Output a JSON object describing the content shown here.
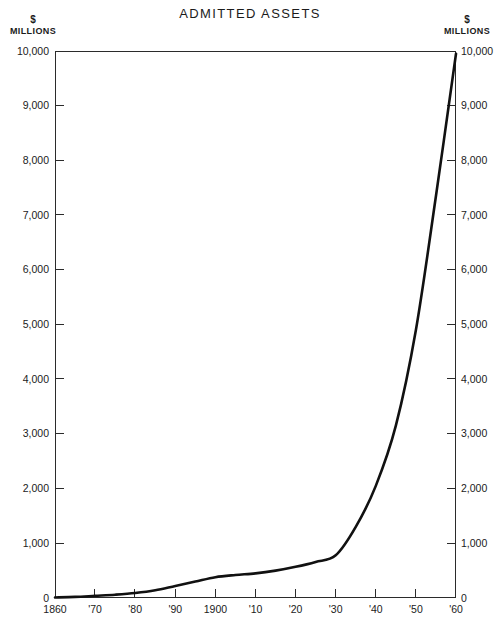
{
  "chart_data": {
    "type": "line",
    "title": "ADMITTED ASSETS",
    "xlabel": "",
    "ylabel": "$ MILLIONS",
    "unit_caption_dollar": "$",
    "unit_caption_millions": "MILLIONS",
    "grid": false,
    "legend": "none",
    "xlim": [
      1860,
      1960
    ],
    "ylim": [
      0,
      10000
    ],
    "y_ticks": [
      0,
      1000,
      2000,
      3000,
      4000,
      5000,
      6000,
      7000,
      8000,
      9000,
      10000
    ],
    "y_tick_labels": [
      "0",
      "1,000",
      "2,000",
      "3,000",
      "4,000",
      "5,000",
      "6,000",
      "7,000",
      "8,000",
      "9,000",
      "10,000"
    ],
    "y_axis_left_labels": [
      "10,000",
      "9,000",
      "8,000",
      "7,000",
      "6,000",
      "5,000",
      "4,000",
      "3,000",
      "2,000",
      "1,000",
      "0"
    ],
    "y_axis_right_labels": [
      "10,000",
      "9,000",
      "8,000",
      "7,000",
      "6,000",
      "5,000",
      "4,000",
      "3,000",
      "2,000",
      "1,000",
      "0"
    ],
    "x_ticks": [
      1860,
      1870,
      1880,
      1890,
      1900,
      1910,
      1920,
      1930,
      1940,
      1950,
      1960
    ],
    "x_tick_labels": [
      "1860",
      "'70",
      "'80",
      "'90",
      "1900",
      "'10",
      "'20",
      "'30",
      "'40",
      "'50",
      "'60"
    ],
    "series": [
      {
        "name": "Admitted Assets",
        "x": [
          1860,
          1865,
          1870,
          1875,
          1880,
          1885,
          1890,
          1895,
          1900,
          1905,
          1910,
          1915,
          1920,
          1925,
          1930,
          1935,
          1940,
          1945,
          1950,
          1955,
          1960
        ],
        "values": [
          10,
          20,
          40,
          60,
          90,
          140,
          220,
          300,
          380,
          420,
          450,
          500,
          570,
          660,
          780,
          1300,
          2050,
          3150,
          4900,
          7350,
          9950
        ]
      }
    ],
    "line_color": "#111111",
    "background_color": "#ffffff",
    "axis_color": "#2b2b2b"
  }
}
